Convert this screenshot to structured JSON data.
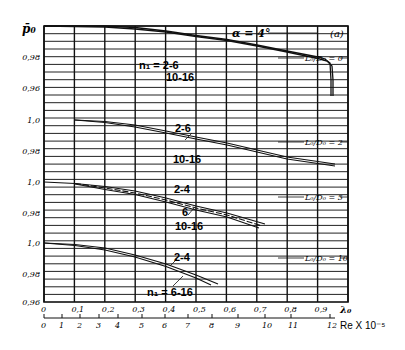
{
  "chart_data": {
    "type": "line",
    "title": "",
    "panel_tag": "(a)",
    "annotation_alpha": "α = 4°",
    "ylabel": "p̄₀",
    "xlabel_primary": "λ₀",
    "xlabel_secondary": "Re X 10⁻⁵",
    "x_ticks_lambda": [
      "0",
      "0,1",
      "0,2",
      "0,3",
      "0,4",
      "0,5",
      "0,6",
      "0,7",
      "0,8",
      "0,9"
    ],
    "x_ticks_re": [
      "0",
      "1",
      "2",
      "3",
      "4",
      "5",
      "6",
      "7",
      "8",
      "9",
      "10",
      "11",
      "12"
    ],
    "xlim": [
      0,
      1.0
    ],
    "grid": true,
    "panels": [
      {
        "label": "L₀/D₀ = 0",
        "y_ticks": [
          "0,98",
          "0,96"
        ],
        "ylim": [
          0.96,
          1.0
        ],
        "series": [
          {
            "name": "n₁ = 2-6",
            "x": [
              0,
              0.2,
              0.3,
              0.4,
              0.5,
              0.6,
              0.7,
              0.8,
              0.9,
              0.915,
              0.925,
              0.93
            ],
            "y": [
              1.0,
              1.0,
              0.999,
              0.997,
              0.994,
              0.9915,
              0.988,
              0.984,
              0.98,
              0.978,
              0.974,
              0.96
            ]
          },
          {
            "name": "10-16",
            "x": [
              0,
              0.2,
              0.3,
              0.4,
              0.5,
              0.6,
              0.7,
              0.8,
              0.9,
              0.92,
              0.93,
              0.935
            ],
            "y": [
              1.0,
              0.9995,
              0.998,
              0.9965,
              0.9935,
              0.991,
              0.9875,
              0.9835,
              0.9795,
              0.977,
              0.972,
              0.96
            ]
          }
        ],
        "annotations": [
          "n₁ = 2-6",
          "10-16"
        ]
      },
      {
        "label": "L₀/D₀ = 2",
        "y_ticks": [
          "1,0",
          "0,98"
        ],
        "ylim": [
          0.97,
          1.0
        ],
        "series": [
          {
            "name": "2-6",
            "x": [
              0.1,
              0.2,
              0.3,
              0.4,
              0.5,
              0.6,
              0.7,
              0.8,
              0.88
            ],
            "y": [
              1.0,
              0.999,
              0.996,
              0.993,
              0.9895,
              0.986,
              0.9825,
              0.979,
              0.9765
            ]
          },
          {
            "name": "10-16",
            "x": [
              0.1,
              0.2,
              0.3,
              0.4,
              0.5,
              0.6,
              0.7,
              0.8,
              0.88
            ],
            "y": [
              1.0,
              0.9985,
              0.9955,
              0.992,
              0.9885,
              0.985,
              0.9815,
              0.978,
              0.9755
            ]
          }
        ],
        "annotations": [
          "2-6",
          "10-16"
        ]
      },
      {
        "label": "L₀/D₀ = 5",
        "y_ticks": [
          "1,0",
          "0,98"
        ],
        "ylim": [
          0.97,
          1.0
        ],
        "series": [
          {
            "name": "2-4",
            "x": [
              0,
              0.1,
              0.2,
              0.3,
              0.4,
              0.5,
              0.6,
              0.72
            ],
            "y": [
              1.0,
              0.999,
              0.997,
              0.994,
              0.9895,
              0.985,
              0.9805,
              0.975
            ]
          },
          {
            "name": "6",
            "x": [
              0.1,
              0.2,
              0.3,
              0.4,
              0.5,
              0.6,
              0.71
            ],
            "y": [
              0.999,
              0.9965,
              0.9935,
              0.989,
              0.9845,
              0.98,
              0.9745
            ]
          },
          {
            "name": "10-16",
            "x": [
              0.1,
              0.2,
              0.3,
              0.4,
              0.5,
              0.6,
              0.7
            ],
            "y": [
              0.9985,
              0.996,
              0.993,
              0.9885,
              0.984,
              0.9795,
              0.974
            ]
          }
        ],
        "annotations": [
          "2-4",
          "6",
          "10-16"
        ]
      },
      {
        "label": "L₀/D₀ = 10",
        "y_ticks": [
          "1,0",
          "0,98",
          "0,96"
        ],
        "ylim": [
          0.96,
          1.0
        ],
        "series": [
          {
            "name": "2-4",
            "x": [
              0,
              0.1,
              0.2,
              0.3,
              0.4,
              0.5,
              0.57
            ],
            "y": [
              1.0,
              0.999,
              0.9965,
              0.992,
              0.986,
              0.979,
              0.973
            ]
          },
          {
            "name": "n₁ = 6-16",
            "x": [
              0,
              0.1,
              0.2,
              0.3,
              0.4,
              0.5,
              0.55
            ],
            "y": [
              1.0,
              0.9985,
              0.9955,
              0.991,
              0.985,
              0.978,
              0.973
            ]
          }
        ],
        "annotations": [
          "2-4",
          "n₁ = 6-16"
        ]
      }
    ]
  },
  "labels": {
    "ylabel": "p̄₀",
    "alpha": "α = 4°",
    "tag": "(a)",
    "ld0": "L₀/D₀ = 0",
    "ld2": "L₀/D₀ = 2",
    "ld5": "L₀/D₀ = 5",
    "ld10": "L₀/D₀ = 10",
    "p1_a": "n₁ = 2-6",
    "p1_b": "10-16",
    "p2_a": "2-6",
    "p2_b": "10-16",
    "p3_a": "2-4",
    "p3_b": "6",
    "p3_c": "10-16",
    "p4_a": "2-4",
    "p4_b": "n₁ = 6-16",
    "y_p1_098": "0,98",
    "y_p1_096": "0,96",
    "y_p2_10": "1,0",
    "y_p2_098": "0,98",
    "y_p3_10": "1,0",
    "y_p3_098": "0,98",
    "y_p4_10": "1,0",
    "y_p4_098": "0,98",
    "y_p4_096": "0,96",
    "x_lambda": [
      "0",
      "0,1",
      "0,2",
      "0,3",
      "0,4",
      "0,5",
      "0,6",
      "0,7",
      "0,8",
      "0,9"
    ],
    "lambda_label": "λ₀",
    "x_re": [
      "0",
      "1",
      "2",
      "3",
      "4",
      "5",
      "6",
      "7",
      "8",
      "9",
      "10",
      "11",
      "12"
    ],
    "re_label": "Re X 10⁻⁵"
  }
}
